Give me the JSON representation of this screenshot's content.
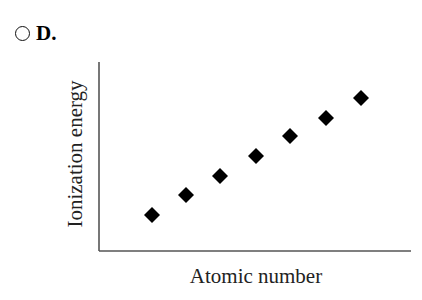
{
  "option": {
    "label": "D.",
    "selected": false,
    "icon": "radio-unchecked-icon"
  },
  "chart_data": {
    "type": "scatter",
    "title": "",
    "xlabel": "Atomic number",
    "ylabel": "Ionization energy",
    "marker": "diamond",
    "marker_color": "#000000",
    "grid": false,
    "legend": null,
    "x_ticks": [],
    "y_ticks": [],
    "x": [
      1,
      2,
      3,
      4,
      5,
      6,
      7
    ],
    "y": [
      1.0,
      2.0,
      3.0,
      4.0,
      5.0,
      6.0,
      7.0
    ],
    "note": "Unlabeled axes; points show a steady linear increase of ionization energy with atomic number.",
    "xlim": [
      0,
      8
    ],
    "ylim": [
      -1.0,
      8.5
    ]
  },
  "layout": {
    "plot_left": 99,
    "plot_right": 411,
    "plot_top": 62,
    "plot_bottom": 251,
    "points_px": [
      [
        152,
        215
      ],
      [
        186,
        195
      ],
      [
        220,
        176
      ],
      [
        256,
        156
      ],
      [
        290,
        136
      ],
      [
        326,
        118
      ],
      [
        361,
        98
      ]
    ]
  }
}
